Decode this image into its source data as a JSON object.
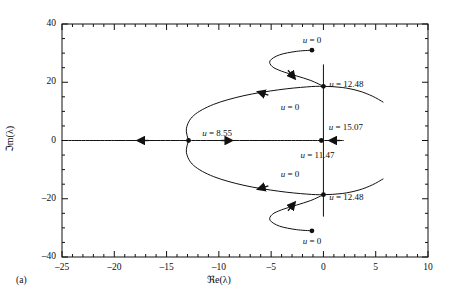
{
  "figure": {
    "panel_label": "(a)",
    "x_axis_title": "ℜe(λ)",
    "y_axis_title": "ℑm(λ)"
  },
  "chart_data": {
    "type": "line",
    "title": "",
    "xlabel": "ℜe(λ)",
    "ylabel": "ℑm(λ)",
    "xlim": [
      -25,
      10
    ],
    "ylim": [
      -40,
      40
    ],
    "xticks": [
      -25,
      -20,
      -15,
      -10,
      -5,
      0,
      5,
      10
    ],
    "xticklabels": [
      "–25",
      "–20",
      "–15",
      "–10",
      "–5",
      "0",
      "5",
      "10"
    ],
    "yticks": [
      -40,
      -20,
      0,
      20,
      40
    ],
    "yticklabels": [
      "–40",
      "–20",
      "0",
      "20",
      "40"
    ],
    "x_minor_step": 1,
    "y_minor_step": 5,
    "grid": false,
    "legend": null,
    "annotations": [
      {
        "text": "u = 0",
        "x": -1.1,
        "y": 34.5,
        "align": "center",
        "note": "start of upper spiral branch"
      },
      {
        "text": "u = 12.48",
        "x": 0.55,
        "y": 19.5,
        "align": "left",
        "note": "upper imaginary-axis crossing"
      },
      {
        "text": "u = 0",
        "x": -3.2,
        "y": 11.5,
        "align": "center",
        "note": "start of upper outer branch"
      },
      {
        "text": "u = 8.55",
        "x": -11.6,
        "y": 2.6,
        "align": "left",
        "note": "real-axis branch point"
      },
      {
        "text": "u = 15.07",
        "x": 0.5,
        "y": 4.6,
        "align": "left",
        "note": "right real-axis limit"
      },
      {
        "text": "u = 11.47",
        "x": -2.2,
        "y": -5.0,
        "align": "left",
        "note": "real-axis confluence point"
      },
      {
        "text": "u = 0",
        "x": -3.2,
        "y": -11.5,
        "align": "center",
        "note": "start of lower outer branch"
      },
      {
        "text": "u = 12.48",
        "x": 0.55,
        "y": -19.5,
        "align": "left",
        "note": "lower imaginary-axis crossing"
      },
      {
        "text": "u = 0",
        "x": -1.1,
        "y": -34.5,
        "align": "center",
        "note": "start of lower spiral branch"
      }
    ],
    "markers": [
      {
        "x": -1.1,
        "y": 31.0,
        "kind": "filled-dot",
        "label": "u = 0"
      },
      {
        "x": 0.0,
        "y": 18.6,
        "kind": "filled-dot",
        "label": "u = 12.48"
      },
      {
        "x": -12.9,
        "y": 0.0,
        "kind": "filled-dot",
        "label": "u = 8.55"
      },
      {
        "x": -0.2,
        "y": 0.0,
        "kind": "filled-dot",
        "label": "u = 11.47 / 15.07"
      },
      {
        "x": 0.0,
        "y": -18.6,
        "kind": "filled-dot",
        "label": "u = 12.48"
      },
      {
        "x": -1.1,
        "y": -31.0,
        "kind": "filled-dot",
        "label": "u = 0"
      }
    ],
    "series": [
      {
        "name": "real-axis branch (leftward)",
        "comment": "from branch point u=8.55 travelling left off-frame",
        "points": [
          [
            -12.9,
            0
          ],
          [
            -16,
            0
          ],
          [
            -20,
            0
          ],
          [
            -25,
            0
          ]
        ],
        "arrows": [
          {
            "x": -17.5,
            "y": 0,
            "dir": 180
          }
        ]
      },
      {
        "name": "real-axis branch (rightward)",
        "comment": "from branch point u=8.55 travelling right to confluence",
        "points": [
          [
            -12.9,
            0
          ],
          [
            -9,
            0
          ],
          [
            -5,
            0
          ],
          [
            -0.2,
            0
          ]
        ],
        "arrows": [
          {
            "x": -9.0,
            "y": 0,
            "dir": 0
          }
        ]
      },
      {
        "name": "real-axis branch (inward from right)",
        "comment": "arrives at confluence u=15.07 from the right",
        "points": [
          [
            1.9,
            0
          ],
          [
            0.6,
            0
          ],
          [
            -0.2,
            0
          ]
        ],
        "arrows": [
          {
            "x": 0.85,
            "y": 0,
            "dir": 180
          }
        ]
      },
      {
        "name": "upper outer branch",
        "comment": "leaves branch point u=8.55 upward, crosses imaginary axis at u=12.48, exits right",
        "points": [
          [
            -12.9,
            0
          ],
          [
            -13.1,
            4.2
          ],
          [
            -12.4,
            8.6
          ],
          [
            -10.5,
            12.4
          ],
          [
            -7.6,
            15.4
          ],
          [
            -4.3,
            17.4
          ],
          [
            -1.6,
            18.4
          ],
          [
            0,
            18.6
          ],
          [
            1.8,
            18.2
          ],
          [
            3.4,
            17.0
          ],
          [
            4.7,
            15.2
          ],
          [
            5.7,
            13.2
          ]
        ],
        "arrows": [
          {
            "x": -6.0,
            "y": 16.4,
            "dir": 163
          }
        ]
      },
      {
        "name": "lower outer branch",
        "comment": "mirror of the upper outer branch",
        "points": [
          [
            -12.9,
            0
          ],
          [
            -13.1,
            -4.2
          ],
          [
            -12.4,
            -8.6
          ],
          [
            -10.5,
            -12.4
          ],
          [
            -7.6,
            -15.4
          ],
          [
            -4.3,
            -17.4
          ],
          [
            -1.6,
            -18.4
          ],
          [
            0,
            -18.6
          ],
          [
            1.8,
            -18.2
          ],
          [
            3.4,
            -17.0
          ],
          [
            4.7,
            -15.2
          ],
          [
            5.7,
            -13.2
          ]
        ],
        "arrows": [
          {
            "x": -6.0,
            "y": -16.4,
            "dir": 197
          }
        ]
      },
      {
        "name": "upper spiral branch",
        "comment": "starts at dot (-1.1, 31), hooks left then descends right to the u=12.48 crossing",
        "points": [
          [
            -1.1,
            31.0
          ],
          [
            -2.6,
            30.6
          ],
          [
            -4.2,
            29.4
          ],
          [
            -5.1,
            27.4
          ],
          [
            -4.9,
            25.4
          ],
          [
            -4.0,
            23.8
          ],
          [
            -2.6,
            22.2
          ],
          [
            -1.2,
            20.6
          ],
          [
            0,
            18.6
          ]
        ],
        "arrows": [
          {
            "x": -2.9,
            "y": 22.0,
            "dir": -50
          }
        ]
      },
      {
        "name": "lower spiral branch",
        "comment": "mirror of the upper spiral branch",
        "points": [
          [
            -1.1,
            -31.0
          ],
          [
            -2.6,
            -30.6
          ],
          [
            -4.2,
            -29.4
          ],
          [
            -5.1,
            -27.4
          ],
          [
            -4.9,
            -25.4
          ],
          [
            -4.0,
            -23.8
          ],
          [
            -2.6,
            -22.2
          ],
          [
            -1.2,
            -20.6
          ],
          [
            0,
            -18.6
          ]
        ],
        "arrows": [
          {
            "x": -2.9,
            "y": -22.0,
            "dir": 50
          }
        ]
      },
      {
        "name": "imaginary axis line (upper)",
        "comment": "vertical reference segment drawn on the plot",
        "points": [
          [
            0,
            26.0
          ],
          [
            0,
            0
          ]
        ],
        "arrows": []
      },
      {
        "name": "imaginary axis line (lower)",
        "comment": "vertical reference segment drawn on the plot",
        "points": [
          [
            0,
            0
          ],
          [
            0,
            -26.0
          ]
        ],
        "arrows": []
      }
    ]
  }
}
